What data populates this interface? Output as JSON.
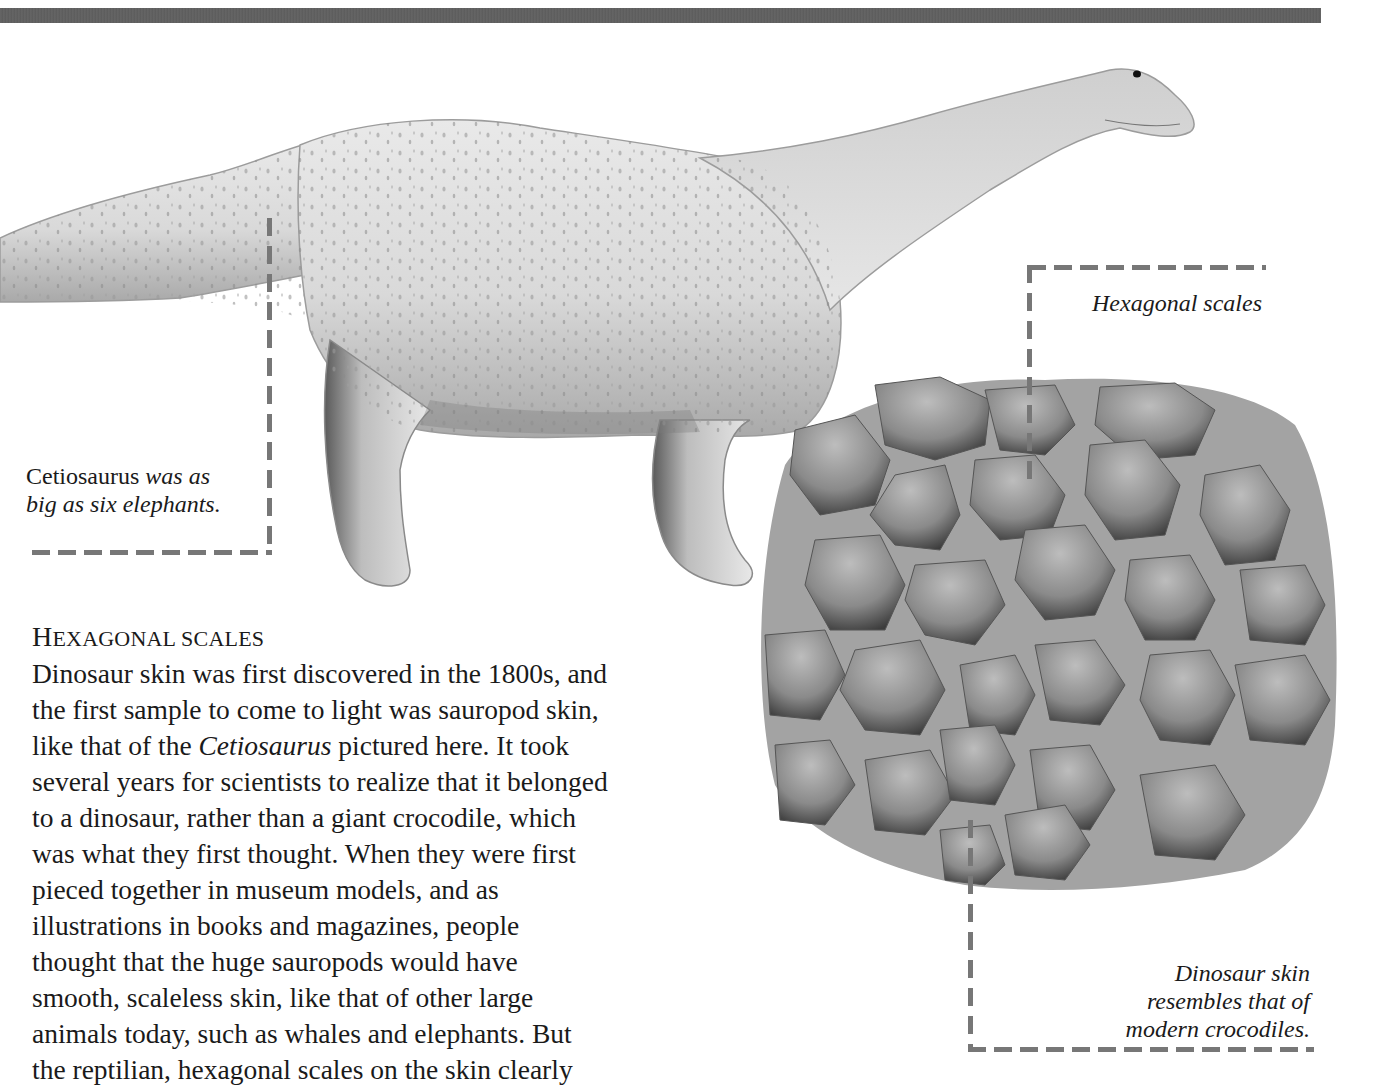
{
  "page": {
    "top_bar_color": "#636363",
    "leader_line_color": "#777777"
  },
  "illustrations": {
    "dinosaur": {
      "name": "Cetiosaurus",
      "icon": "sauropod-illustration"
    },
    "skin_patch": {
      "icon": "hexagonal-scale-skin-illustration"
    }
  },
  "captions": {
    "cetiosaurus": {
      "name": "Cetiosaurus",
      "rest_line1": " was as",
      "line2": "big as six elephants."
    },
    "hexagonal_scales": "Hexagonal scales",
    "dinosaur_skin": {
      "line1": "Dinosaur skin",
      "line2": "resembles that of",
      "line3": "modern crocodiles."
    }
  },
  "article": {
    "heading_first": "H",
    "heading_rest_1": "EXAGONAL",
    "heading_rest_2": " SCALES",
    "heading_full": "Hexagonal scales",
    "body_part1": "Dinosaur skin was first discovered in the 1800s, and\nthe first sample to come to light was sauropod skin,\nlike that of the ",
    "body_italic": "Cetiosaurus",
    "body_part2": " pictured here. It took\nseveral years for scientists to realize that it belonged\nto a dinosaur, rather than a giant crocodile, which\nwas what they first thought. When they were first\npieced together in museum models, and as\nillustrations in books and magazines, people\nthought that the huge sauropods would have\nsmooth, scaleless skin, like that of other large\nanimals today, such as whales and elephants. But\nthe reptilian, hexagonal scales on the skin clearly"
  }
}
